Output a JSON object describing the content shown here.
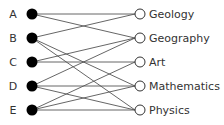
{
  "diagram": {
    "type": "bipartite-graph",
    "left_nodes": [
      {
        "id": "A",
        "label": "A",
        "y": 14
      },
      {
        "id": "B",
        "label": "B",
        "y": 38
      },
      {
        "id": "C",
        "label": "C",
        "y": 62
      },
      {
        "id": "D",
        "label": "D",
        "y": 86
      },
      {
        "id": "E",
        "label": "E",
        "y": 110
      }
    ],
    "right_nodes": [
      {
        "id": "Geology",
        "label": "Geology",
        "y": 14
      },
      {
        "id": "Geography",
        "label": "Geography",
        "y": 38
      },
      {
        "id": "Art",
        "label": "Art",
        "y": 62
      },
      {
        "id": "Mathematics",
        "label": "Mathematics",
        "y": 86
      },
      {
        "id": "Physics",
        "label": "Physics",
        "y": 110
      }
    ],
    "edges": [
      [
        "A",
        "Geology"
      ],
      [
        "A",
        "Geography"
      ],
      [
        "B",
        "Geology"
      ],
      [
        "B",
        "Mathematics"
      ],
      [
        "B",
        "Physics"
      ],
      [
        "C",
        "Geography"
      ],
      [
        "C",
        "Art"
      ],
      [
        "D",
        "Geography"
      ],
      [
        "D",
        "Mathematics"
      ],
      [
        "D",
        "Physics"
      ],
      [
        "E",
        "Art"
      ],
      [
        "E",
        "Mathematics"
      ],
      [
        "E",
        "Physics"
      ]
    ],
    "colors": {
      "left_node_fill": "#000000",
      "right_node_fill": "#ffffff",
      "edge": "#555555",
      "text": "#333333"
    }
  }
}
